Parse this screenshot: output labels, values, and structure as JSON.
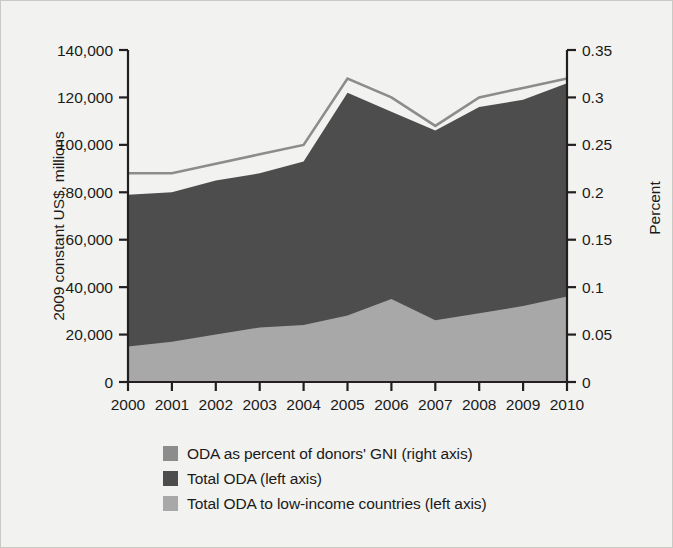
{
  "chart_data": {
    "type": "area",
    "title": "",
    "subtitle": "",
    "xlabel": "",
    "ylabel": "2009 constant US$, millions",
    "ylabel_right": "Percent",
    "categories": [
      "2000",
      "2001",
      "2002",
      "2003",
      "2004",
      "2005",
      "2006",
      "2007",
      "2008",
      "2009",
      "2010"
    ],
    "x": [
      2000,
      2001,
      2002,
      2003,
      2004,
      2005,
      2006,
      2007,
      2008,
      2009,
      2010
    ],
    "ylim": [
      0,
      140000
    ],
    "ylim_right": [
      0,
      0.35
    ],
    "yticks": [
      0,
      20000,
      40000,
      60000,
      80000,
      100000,
      120000,
      140000
    ],
    "ytick_labels": [
      "0",
      "20,000",
      "40,000",
      "60,000",
      "80,000",
      "100,000",
      "120,000",
      "140,000"
    ],
    "yticks_right": [
      0,
      0.05,
      0.1,
      0.15,
      0.2,
      0.25,
      0.3,
      0.35
    ],
    "ytick_labels_right": [
      "0",
      "0.05",
      "0.1",
      "0.15",
      "0.2",
      "0.25",
      "0.3",
      "0.35"
    ],
    "grid": false,
    "legend_position": "bottom-left",
    "series": [
      {
        "name": "ODA as percent of donors' GNI (right axis)",
        "type": "line",
        "axis": "right",
        "color": "#8c8c8c",
        "values": [
          0.22,
          0.22,
          0.23,
          0.24,
          0.25,
          0.32,
          0.3,
          0.27,
          0.3,
          0.31,
          0.32
        ]
      },
      {
        "name": "Total ODA (left axis)",
        "type": "area",
        "axis": "left",
        "color": "#4d4d4d",
        "values": [
          79000,
          80000,
          85000,
          88000,
          93000,
          122000,
          114000,
          106000,
          116000,
          119000,
          126000
        ]
      },
      {
        "name": "Total ODA to low-income countries (left axis)",
        "type": "area",
        "axis": "left",
        "color": "#a8a8a8",
        "values": [
          15000,
          17000,
          20000,
          23000,
          24000,
          28000,
          35000,
          26000,
          29000,
          32000,
          36000
        ]
      }
    ]
  },
  "axes": {
    "left_title": "2009 constant US$, millions",
    "right_title": "Percent"
  },
  "legend": {
    "items": [
      {
        "label": "ODA as percent of donors' GNI (right axis)",
        "color": "#8c8c8c"
      },
      {
        "label": "Total ODA (left axis)",
        "color": "#4d4d4d"
      },
      {
        "label": "Total ODA to low-income countries (left axis)",
        "color": "#a8a8a8"
      }
    ]
  },
  "colors": {
    "background": "#f2f2f0",
    "axis": "#231f20",
    "line_series": "#8c8c8c",
    "total_oda": "#4d4d4d",
    "low_income": "#a8a8a8"
  }
}
